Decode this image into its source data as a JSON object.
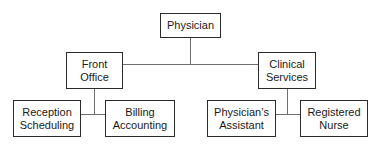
{
  "diagram": {
    "type": "organizational-chart",
    "colors": {
      "box_border": "#2b2b2b",
      "box_fill": "#ffffff",
      "connector": "#6e6e6e",
      "text": "#1a1a1a",
      "background": "#ffffff"
    },
    "nodes": [
      {
        "id": "physician",
        "level": 0,
        "line1": "Physician",
        "line2": "",
        "x": 160,
        "y": 13,
        "w": 61,
        "h": 25
      },
      {
        "id": "front-office",
        "level": 1,
        "line1": "Front",
        "line2": "Office",
        "x": 66,
        "y": 52,
        "w": 57,
        "h": 37
      },
      {
        "id": "clinical-services",
        "level": 1,
        "line1": "Clinical",
        "line2": "Services",
        "x": 258,
        "y": 52,
        "w": 58,
        "h": 37
      },
      {
        "id": "reception-scheduling",
        "level": 2,
        "line1": "Reception",
        "line2": "Scheduling",
        "x": 13,
        "y": 100,
        "w": 68,
        "h": 37
      },
      {
        "id": "billing-accounting",
        "level": 2,
        "line1": "Billing",
        "line2": "Accounting",
        "x": 105,
        "y": 100,
        "w": 70,
        "h": 37
      },
      {
        "id": "physicians-assistant",
        "level": 2,
        "line1": "Physician’s",
        "line2": "Assistant",
        "x": 207,
        "y": 100,
        "w": 69,
        "h": 37
      },
      {
        "id": "registered-nurse",
        "level": 2,
        "line1": "Registered",
        "line2": "Nurse",
        "x": 300,
        "y": 100,
        "w": 68,
        "h": 37
      }
    ],
    "edges": [
      {
        "from": "physician",
        "to": "spine-top",
        "kind": "vertical"
      },
      {
        "from": "spine-top",
        "to": "front-office",
        "kind": "horizontal"
      },
      {
        "from": "spine-top",
        "to": "clinical-services",
        "kind": "horizontal"
      },
      {
        "from": "front-office",
        "to": "left-branch",
        "kind": "vertical"
      },
      {
        "from": "left-branch",
        "to": "reception-scheduling",
        "kind": "horizontal"
      },
      {
        "from": "left-branch",
        "to": "billing-accounting",
        "kind": "horizontal"
      },
      {
        "from": "clinical-services",
        "to": "right-branch",
        "kind": "vertical"
      },
      {
        "from": "right-branch",
        "to": "physicians-assistant",
        "kind": "horizontal"
      },
      {
        "from": "right-branch",
        "to": "registered-nurse",
        "kind": "horizontal"
      }
    ]
  }
}
